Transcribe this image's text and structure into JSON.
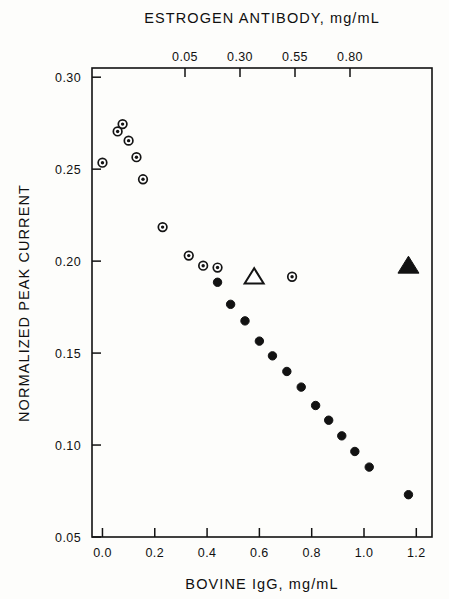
{
  "chart_data": {
    "type": "scatter",
    "title": "",
    "xlabel": "BOVINE IgG, mg/mL",
    "ylabel": "NORMALIZED PEAK CURRENT",
    "top_axis_label": "ESTROGEN ANTIBODY, mg/mL",
    "xlim": [
      -0.04,
      1.26
    ],
    "ylim": [
      0.05,
      0.305
    ],
    "xticks": [
      "0.0",
      "0.2",
      "0.4",
      "0.6",
      "0.8",
      "1.0",
      "1.2"
    ],
    "xtick_values": [
      0.0,
      0.2,
      0.4,
      0.6,
      0.8,
      1.0,
      1.2
    ],
    "yticks": [
      "0.30",
      "0.25",
      "0.20",
      "0.15",
      "0.10",
      "0.05"
    ],
    "ytick_values": [
      0.3,
      0.25,
      0.2,
      0.15,
      0.1,
      0.05
    ],
    "top_xticks": [
      "0.05",
      "0.30",
      "0.55",
      "0.80"
    ],
    "top_xtick_values": [
      0.05,
      0.3,
      0.55,
      0.8
    ],
    "grid": false,
    "legend": "none",
    "series": [
      {
        "name": "estrogen-antibody-series",
        "marker": "circle-with-center-dot",
        "color": "#141414",
        "points": [
          {
            "x": 0.0,
            "y": 0.2535
          },
          {
            "x": 0.058,
            "y": 0.2705
          },
          {
            "x": 0.077,
            "y": 0.2745
          },
          {
            "x": 0.1,
            "y": 0.2655
          },
          {
            "x": 0.13,
            "y": 0.2565
          },
          {
            "x": 0.155,
            "y": 0.2445
          },
          {
            "x": 0.23,
            "y": 0.2185
          },
          {
            "x": 0.33,
            "y": 0.203
          },
          {
            "x": 0.385,
            "y": 0.1975
          },
          {
            "x": 0.44,
            "y": 0.1965
          },
          {
            "x": 0.58,
            "y": 0.1915
          },
          {
            "x": 0.725,
            "y": 0.1915
          }
        ]
      },
      {
        "name": "bovine-igg-series",
        "marker": "filled-circle",
        "color": "#121212",
        "points": [
          {
            "x": 0.44,
            "y": 0.1885
          },
          {
            "x": 0.49,
            "y": 0.1765
          },
          {
            "x": 0.545,
            "y": 0.1675
          },
          {
            "x": 0.6,
            "y": 0.1565
          },
          {
            "x": 0.65,
            "y": 0.1485
          },
          {
            "x": 0.705,
            "y": 0.14
          },
          {
            "x": 0.76,
            "y": 0.1315
          },
          {
            "x": 0.815,
            "y": 0.1215
          },
          {
            "x": 0.865,
            "y": 0.1135
          },
          {
            "x": 0.915,
            "y": 0.105
          },
          {
            "x": 0.965,
            "y": 0.0965
          },
          {
            "x": 1.02,
            "y": 0.088
          },
          {
            "x": 1.17,
            "y": 0.073
          }
        ]
      },
      {
        "name": "open-triangle-marker",
        "marker": "open-triangle",
        "color": "#141414",
        "points": [
          {
            "x": 0.58,
            "y": 0.1915
          }
        ]
      },
      {
        "name": "filled-triangle-marker",
        "marker": "filled-triangle",
        "color": "#121212",
        "points": [
          {
            "x": 1.17,
            "y": 0.1975
          }
        ]
      }
    ]
  }
}
